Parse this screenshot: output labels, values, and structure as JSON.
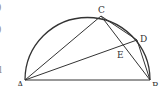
{
  "figure": {
    "points": {
      "A": {
        "label": "A"
      },
      "B": {
        "label": "B"
      },
      "C": {
        "label": "C"
      },
      "D": {
        "label": "D"
      },
      "E": {
        "label": "E"
      }
    },
    "segments": [
      "AB",
      "AC",
      "AD",
      "BC",
      "BD",
      "CD"
    ],
    "edge_fragments": [
      ")",
      ")",
      "l"
    ]
  }
}
